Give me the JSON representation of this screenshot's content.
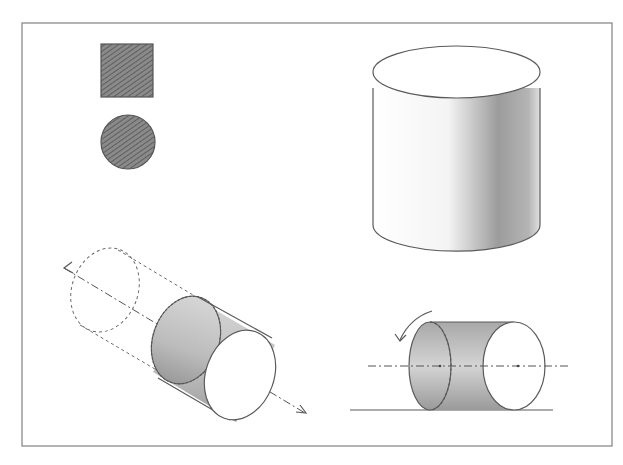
{
  "figure": {
    "colors": {
      "frame": "#8a8a8a",
      "pencil": "#5a5a5a",
      "shade_dark": "#6e6e6e",
      "shade_light": "#d8d8d8",
      "background": "#ffffff"
    },
    "panels": [
      {
        "id": "projections",
        "shapes": [
          "square",
          "circle"
        ]
      },
      {
        "id": "upright-cylinder",
        "shapes": [
          "cylinder"
        ]
      },
      {
        "id": "translated-cylinder",
        "shapes": [
          "dashed-ghost-cylinder",
          "cylinder",
          "double-arrow-axis"
        ]
      },
      {
        "id": "rolling-cylinder",
        "shapes": [
          "cylinder",
          "rotation-arrow",
          "center-axis",
          "ground-line"
        ]
      }
    ]
  }
}
